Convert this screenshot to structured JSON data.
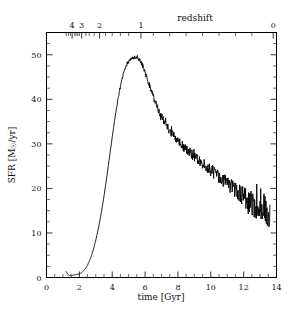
{
  "figure": {
    "title": "",
    "bottom_axis_label": "time [Gyr]",
    "left_axis_label": "SFR [M⊙/yr]",
    "top_axis_label": "redshift"
  },
  "chart_data": {
    "type": "line",
    "title": "",
    "xlabel": "time [Gyr]",
    "ylabel": "SFR [M⊙/yr]",
    "xlim": [
      0,
      14
    ],
    "ylim": [
      0,
      55
    ],
    "grid": false,
    "legend": null,
    "x_major_ticks": [
      0,
      2,
      4,
      6,
      8,
      10,
      12,
      14
    ],
    "x_major_tick_labels": [
      "0",
      "2",
      "4",
      "6",
      "8",
      "10",
      "12",
      "14"
    ],
    "x_minor_tick_step": 0.5,
    "y_major_ticks": [
      0,
      10,
      20,
      30,
      40,
      50
    ],
    "y_major_tick_labels": [
      "0",
      "10",
      "20",
      "30",
      "40",
      "50"
    ],
    "y_minor_tick_step": 2.5,
    "secondary_x_axis": {
      "label": "redshift",
      "tick_values": [
        4,
        3,
        2,
        1,
        0
      ],
      "tick_labels": [
        "4",
        "3",
        "2",
        "1",
        "0"
      ],
      "tick_time_gyr": [
        1.56,
        2.14,
        3.23,
        5.75,
        13.8
      ],
      "minor_tick_time_gyr": [
        1.2,
        1.33,
        1.45,
        1.72,
        1.8,
        1.9,
        2.0,
        2.4,
        2.6,
        2.9,
        3.6,
        4.0,
        4.5,
        5.0,
        6.5,
        7.5,
        8.5,
        9.5,
        10.5,
        11.5,
        12.5
      ],
      "note": "non-linear mapping, compressed toward high redshift"
    },
    "series": [
      {
        "name": "Star formation rate history",
        "x": [
          1.2,
          1.3,
          1.4,
          1.5,
          1.6,
          1.7,
          1.8,
          1.9,
          2.0,
          2.1,
          2.2,
          2.3,
          2.4,
          2.5,
          2.6,
          2.7,
          2.8,
          2.9,
          3.0,
          3.1,
          3.2,
          3.3,
          3.4,
          3.5,
          3.6,
          3.7,
          3.8,
          3.9,
          4.0,
          4.1,
          4.2,
          4.3,
          4.4,
          4.5,
          4.6,
          4.7,
          4.8,
          4.9,
          5.0,
          5.1,
          5.2,
          5.3,
          5.4,
          5.5,
          5.6,
          5.7,
          5.8,
          5.9,
          6.0,
          6.1,
          6.2,
          6.3,
          6.4,
          6.5,
          6.6,
          6.7,
          6.8,
          6.9,
          7.0,
          7.2,
          7.4,
          7.6,
          7.8,
          8.0,
          8.2,
          8.4,
          8.6,
          8.8,
          9.0,
          9.2,
          9.4,
          9.6,
          9.8,
          10.0,
          10.2,
          10.4,
          10.6,
          10.8,
          11.0,
          11.2,
          11.4,
          11.6,
          11.8,
          12.0,
          12.2,
          12.4,
          12.6,
          12.8,
          13.0,
          13.2,
          13.4,
          13.5,
          13.6
        ],
        "y": [
          1.3,
          0.7,
          0.45,
          0.4,
          0.5,
          0.6,
          0.65,
          0.7,
          0.8,
          1.0,
          1.3,
          1.7,
          2.2,
          2.8,
          3.6,
          4.5,
          5.6,
          6.9,
          8.4,
          10.0,
          11.8,
          13.8,
          16.0,
          18.3,
          20.8,
          23.4,
          26.1,
          28.8,
          31.5,
          34.1,
          36.6,
          38.9,
          41.0,
          42.9,
          44.5,
          45.9,
          47.0,
          47.9,
          48.5,
          48.9,
          49.1,
          49.3,
          49.4,
          49.5,
          49.2,
          48.7,
          48.0,
          47.1,
          46.1,
          45.0,
          43.9,
          42.8,
          41.7,
          40.6,
          39.6,
          38.7,
          37.8,
          37.0,
          36.2,
          34.8,
          33.6,
          32.5,
          31.5,
          30.6,
          29.8,
          29.1,
          28.4,
          27.8,
          27.2,
          26.6,
          26.0,
          25.4,
          24.8,
          24.2,
          23.6,
          23.0,
          22.4,
          21.8,
          21.2,
          20.6,
          20.0,
          19.4,
          18.8,
          18.2,
          17.6,
          17.0,
          16.4,
          16.0,
          15.6,
          15.8,
          14.6,
          13.2,
          12.9
        ],
        "noise": "stochastic scatter increasing with time; amplitude ~0.3 at peak rising to ~2 at late times"
      }
    ]
  }
}
